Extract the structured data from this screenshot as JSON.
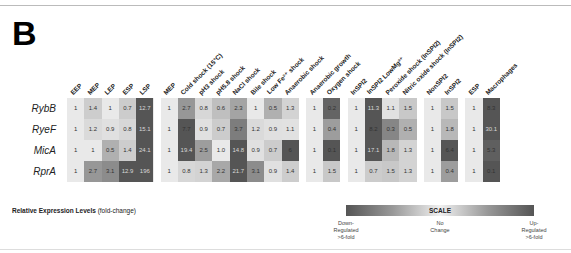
{
  "panel_label": "B",
  "chart_data": {
    "type": "heatmap",
    "title": "Relative Expression Levels (fold-change)",
    "rows": [
      "RybB",
      "RyeF",
      "MicA",
      "RprA"
    ],
    "groups": [
      {
        "columns": [
          "EEP",
          "MEP",
          "LEP",
          "ESP",
          "LSP"
        ],
        "values": [
          [
            "1",
            "1.4",
            "1",
            "0.7",
            "12.7"
          ],
          [
            "1",
            "1.2",
            "0.9",
            "0.8",
            "15.1"
          ],
          [
            "1",
            "1",
            "0.5",
            "1.4",
            "24.1"
          ],
          [
            "1",
            "2.7",
            "3.1",
            "12.9",
            "196"
          ]
        ]
      },
      {
        "columns": [
          "MEP",
          "Cold shock (15°C)",
          "pH3 shock",
          "pH5.8 shock",
          "NaCl shock",
          "Bile shock",
          "Low Fe²⁺ shock",
          "Anaerobic shock"
        ],
        "values": [
          [
            "1",
            "2.7",
            "0.8",
            "0.6",
            "2.3",
            "1",
            "0.5",
            "1.3"
          ],
          [
            "1",
            "7.7",
            "0.9",
            "0.7",
            "3.7",
            "1.2",
            "0.9",
            "1.1"
          ],
          [
            "1",
            "19.4",
            "2.5",
            "1.0",
            "14.8",
            "0.9",
            "0.7",
            "6"
          ],
          [
            "1",
            "0.8",
            "1.3",
            "2.2",
            "21.7",
            "3.1",
            "0.9",
            "1.4"
          ]
        ]
      },
      {
        "columns": [
          "Anaerobic growth",
          "Oxygen shock"
        ],
        "values": [
          [
            "1",
            "0.2"
          ],
          [
            "1",
            "0.4"
          ],
          [
            "1",
            "0.1"
          ],
          [
            "1",
            "1.5"
          ]
        ]
      },
      {
        "columns": [
          "InSPI2",
          "InSPI2 LowMg²⁺",
          "Peroxide shock (InSPI2)",
          "Nitric oxide shock (InSPI2)"
        ],
        "values": [
          [
            "1",
            "11.3",
            "1.1",
            "1.5"
          ],
          [
            "1",
            "8.2",
            "0.3",
            "0.5"
          ],
          [
            "1",
            "17.1",
            "1.8",
            "1.3"
          ],
          [
            "1",
            "0.7",
            "1.5",
            "1.3"
          ]
        ]
      },
      {
        "columns": [
          "NonSPI2",
          "InSPI2"
        ],
        "values": [
          [
            "1",
            "1.5"
          ],
          [
            "1",
            "1.8"
          ],
          [
            "1",
            "6.4"
          ],
          [
            "1",
            "0.4"
          ]
        ]
      },
      {
        "columns": [
          "ESP",
          "Macrophages"
        ],
        "values": [
          [
            "1",
            "8.3"
          ],
          [
            "1",
            "30.1"
          ],
          [
            "1",
            "5.3"
          ],
          [
            "1",
            "0.1"
          ]
        ]
      }
    ],
    "scale": {
      "label": "SCALE",
      "left": "Down-Regulated >6-fold",
      "center": "No Change",
      "right": "Up-Regulated >6-fold"
    }
  },
  "legend": {
    "title_bold": "Relative Expression Levels",
    "title_rest": " (fold-change)"
  },
  "scale": {
    "label": "SCALE",
    "left": [
      "Down-",
      "Regulated",
      ">6-fold"
    ],
    "center": [
      "No",
      "Change"
    ],
    "right": [
      "Up-",
      "Regulated",
      ">6-fold"
    ]
  },
  "colors": {
    "no_change": "#e9e9e9",
    "strong": "#555555"
  }
}
